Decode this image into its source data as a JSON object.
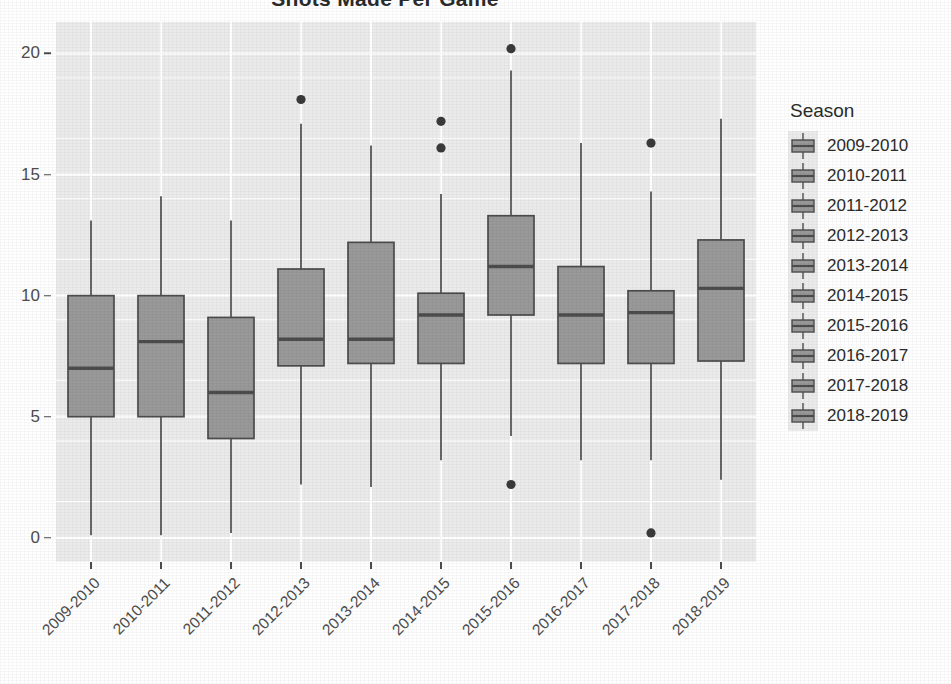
{
  "chart_data": {
    "type": "box",
    "title": "Shots Made Per Game",
    "xlabel": "",
    "ylabel": "",
    "ylim": [
      -1.0,
      21.3
    ],
    "yticks": [
      0,
      5,
      10,
      15,
      20
    ],
    "ytick_labels": [
      "0",
      "5",
      "10",
      "15",
      "20"
    ],
    "grid": true,
    "grid_color": "#ffffff",
    "panel_background": "#ebebeb",
    "box_fill": "#999999",
    "box_outline": "#4d4d4d",
    "legend_position": "right",
    "legend_title": "Season",
    "categories": [
      "2009-2010",
      "2010-2011",
      "2011-2012",
      "2012-2013",
      "2013-2014",
      "2014-2015",
      "2015-2016",
      "2016-2017",
      "2017-2018",
      "2018-2019"
    ],
    "boxes": [
      {
        "category": "2009-2010",
        "whisker_low": 0.1,
        "q1": 5.0,
        "median": 7.0,
        "q3": 10.0,
        "whisker_high": 13.1,
        "outliers": []
      },
      {
        "category": "2010-2011",
        "whisker_low": 0.1,
        "q1": 5.0,
        "median": 8.1,
        "q3": 10.0,
        "whisker_high": 14.1,
        "outliers": []
      },
      {
        "category": "2011-2012",
        "whisker_low": 0.2,
        "q1": 4.1,
        "median": 6.0,
        "q3": 9.1,
        "whisker_high": 13.1,
        "outliers": []
      },
      {
        "category": "2012-2013",
        "whisker_low": 2.2,
        "q1": 7.1,
        "median": 8.2,
        "q3": 11.1,
        "whisker_high": 17.1,
        "outliers": [
          18.1
        ]
      },
      {
        "category": "2013-2014",
        "whisker_low": 2.1,
        "q1": 7.2,
        "median": 8.2,
        "q3": 12.2,
        "whisker_high": 16.2,
        "outliers": []
      },
      {
        "category": "2014-2015",
        "whisker_low": 3.2,
        "q1": 7.2,
        "median": 9.2,
        "q3": 10.1,
        "whisker_high": 14.2,
        "outliers": [
          17.2,
          16.1
        ]
      },
      {
        "category": "2015-2016",
        "whisker_low": 4.2,
        "q1": 9.2,
        "median": 11.2,
        "q3": 13.3,
        "whisker_high": 19.3,
        "outliers": [
          20.2,
          2.2
        ]
      },
      {
        "category": "2016-2017",
        "whisker_low": 3.2,
        "q1": 7.2,
        "median": 9.2,
        "q3": 11.2,
        "whisker_high": 16.3,
        "outliers": []
      },
      {
        "category": "2017-2018",
        "whisker_low": 3.2,
        "q1": 7.2,
        "median": 9.3,
        "q3": 10.2,
        "whisker_high": 14.3,
        "outliers": [
          16.3,
          0.2
        ]
      },
      {
        "category": "2018-2019",
        "whisker_low": 2.4,
        "q1": 7.3,
        "median": 10.3,
        "q3": 12.3,
        "whisker_high": 17.3,
        "outliers": []
      }
    ]
  },
  "legend": {
    "title": "Season",
    "items": [
      {
        "label": "2009-2010"
      },
      {
        "label": "2010-2011"
      },
      {
        "label": "2011-2012"
      },
      {
        "label": "2012-2013"
      },
      {
        "label": "2013-2014"
      },
      {
        "label": "2014-2015"
      },
      {
        "label": "2015-2016"
      },
      {
        "label": "2016-2017"
      },
      {
        "label": "2017-2018"
      },
      {
        "label": "2018-2019"
      }
    ]
  }
}
